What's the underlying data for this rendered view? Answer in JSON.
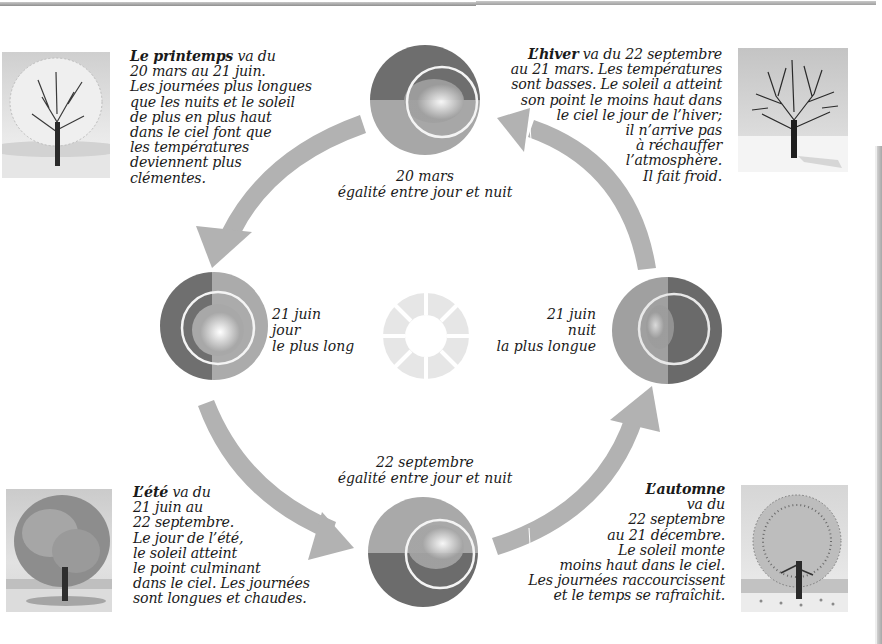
{
  "colors": {
    "arrow": "#b2b2b2",
    "text": "#1a1a1a",
    "background": "#ffffff",
    "globe_dark": "#6e6e6e",
    "globe_light": "#a9a9a9",
    "sun": "#e9e9e9"
  },
  "icons": {
    "spring_tree": "spring-tree-illustration",
    "winter_tree": "winter-tree-illustration",
    "summer_tree": "summer-tree-illustration",
    "autumn_tree": "autumn-tree-illustration",
    "sun": "sun-icon",
    "globe": "earth-globe-icon",
    "arrow": "curved-arrow-icon"
  },
  "seasons": {
    "spring": {
      "name": "Le printemps",
      "first_line_rest": " va du",
      "lines": [
        "20 mars au 21 juin.",
        "Les journées plus longues",
        "que les nuits et le soleil",
        "de plus en plus haut",
        "dans le ciel font que",
        "les températures",
        "deviennent plus",
        "clémentes."
      ]
    },
    "winter": {
      "name": "L’hiver",
      "first_line_rest": " va du 22 septembre",
      "lines": [
        "au 21 mars. Les températures",
        "sont basses. Le soleil a atteint",
        "son point le moins haut dans",
        "le ciel le jour de l’hiver;",
        "il n’arrive pas",
        "à réchauffer",
        "l’atmosphère.",
        "Il fait froid."
      ]
    },
    "summer": {
      "name": "L’été",
      "first_line_rest": " va du",
      "lines": [
        "21 juin au",
        "22 septembre.",
        "Le jour de l’été,",
        "le soleil atteint",
        "le point culminant",
        "dans le ciel. Les journées",
        "sont longues et chaudes."
      ]
    },
    "autumn": {
      "name": "L’automne",
      "lines": [
        "va du",
        "22 septembre",
        "au 21 décembre.",
        "Le soleil monte",
        "moins haut dans le ciel.",
        "Les journées raccourcissent",
        "et le temps se rafraîchit."
      ]
    }
  },
  "events": {
    "march": {
      "lines": [
        "20 mars",
        "égalité entre jour et nuit"
      ]
    },
    "june_day": {
      "lines": [
        "21 juin",
        "jour",
        "le plus long"
      ]
    },
    "june_night": {
      "lines": [
        "21 juin",
        "nuit",
        "la plus longue"
      ]
    },
    "september": {
      "lines": [
        "22 septembre",
        "égalité entre jour et nuit"
      ]
    }
  }
}
